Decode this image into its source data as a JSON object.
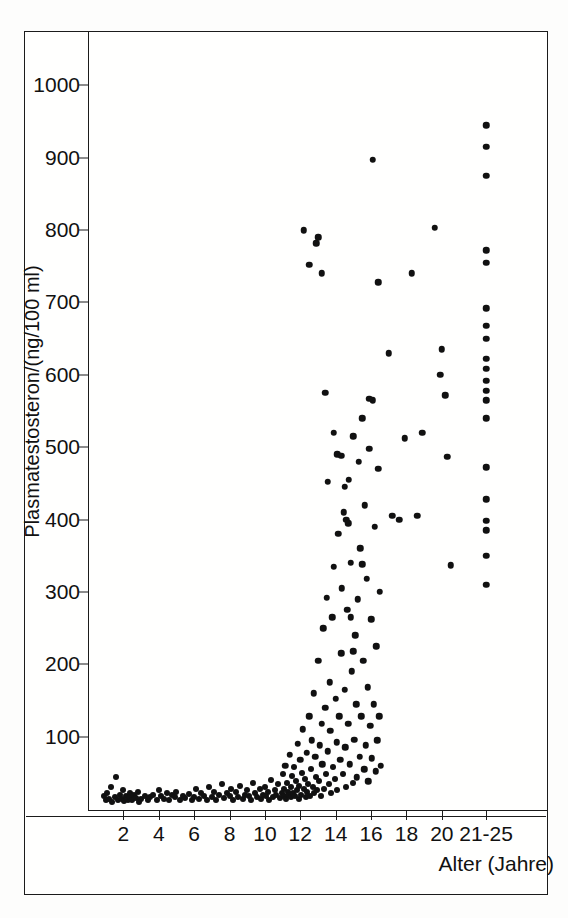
{
  "figure": {
    "kind": "scientific-scatter-figure",
    "background_color": "#fdfdfc",
    "ink_color": "#111111"
  },
  "axes": {
    "y_label": "Plasmatestosteron/(ng/100 ml)",
    "x_label": "Alter (Jahre)",
    "y_ticks": [
      "100",
      "200",
      "300",
      "400",
      "500",
      "600",
      "700",
      "800",
      "900",
      "1000"
    ],
    "x_ticks": [
      "2",
      "4",
      "6",
      "8",
      "10",
      "12",
      "14",
      "16",
      "18",
      "20",
      "21-25"
    ]
  },
  "chart_data": {
    "type": "scatter",
    "title": "",
    "xlabel": "Alter (Jahre)",
    "ylabel": "Plasmatestosteron/(ng/100 ml)",
    "xlim": [
      0,
      26
    ],
    "ylim": [
      0,
      1075
    ],
    "grid": false,
    "legend": null,
    "x_tick_values": [
      2,
      4,
      6,
      8,
      10,
      12,
      14,
      16,
      18,
      20,
      22.5
    ],
    "x_tick_labels": [
      "2",
      "4",
      "6",
      "8",
      "10",
      "12",
      "14",
      "16",
      "18",
      "20",
      "21-25"
    ],
    "y_tick_values": [
      100,
      200,
      300,
      400,
      500,
      600,
      700,
      800,
      900,
      1000
    ],
    "y_tick_labels": [
      "100",
      "200",
      "300",
      "400",
      "500",
      "600",
      "700",
      "800",
      "900",
      "1000"
    ],
    "marker": "filled-circle",
    "marker_color": "#111111",
    "note": "Serum testosterone versus age in boys/men; values rise sharply after age ~11.",
    "points": [
      [
        0.9,
        18
      ],
      [
        1.0,
        12
      ],
      [
        1.1,
        22
      ],
      [
        1.2,
        14
      ],
      [
        1.3,
        30
      ],
      [
        1.35,
        10
      ],
      [
        1.5,
        16
      ],
      [
        1.6,
        44
      ],
      [
        1.7,
        12
      ],
      [
        1.8,
        20
      ],
      [
        1.9,
        14
      ],
      [
        2.0,
        26
      ],
      [
        2.05,
        11
      ],
      [
        2.15,
        18
      ],
      [
        2.25,
        13
      ],
      [
        2.35,
        22
      ],
      [
        2.4,
        16
      ],
      [
        2.5,
        12
      ],
      [
        2.6,
        20
      ],
      [
        2.7,
        15
      ],
      [
        2.8,
        24
      ],
      [
        2.9,
        10
      ],
      [
        3.0,
        14
      ],
      [
        3.2,
        18
      ],
      [
        3.4,
        12
      ],
      [
        3.5,
        16
      ],
      [
        3.7,
        20
      ],
      [
        3.9,
        13
      ],
      [
        4.0,
        26
      ],
      [
        4.15,
        18
      ],
      [
        4.3,
        14
      ],
      [
        4.45,
        22
      ],
      [
        4.6,
        12
      ],
      [
        4.75,
        20
      ],
      [
        4.9,
        16
      ],
      [
        5.0,
        24
      ],
      [
        5.2,
        13
      ],
      [
        5.35,
        18
      ],
      [
        5.5,
        15
      ],
      [
        5.7,
        21
      ],
      [
        5.85,
        12
      ],
      [
        6.0,
        17
      ],
      [
        6.1,
        28
      ],
      [
        6.25,
        14
      ],
      [
        6.4,
        22
      ],
      [
        6.55,
        18
      ],
      [
        6.7,
        12
      ],
      [
        6.85,
        30
      ],
      [
        7.0,
        16
      ],
      [
        7.1,
        24
      ],
      [
        7.25,
        13
      ],
      [
        7.4,
        20
      ],
      [
        7.55,
        34
      ],
      [
        7.7,
        15
      ],
      [
        7.85,
        22
      ],
      [
        8.0,
        18
      ],
      [
        8.1,
        28
      ],
      [
        8.2,
        12
      ],
      [
        8.35,
        24
      ],
      [
        8.5,
        16
      ],
      [
        8.6,
        32
      ],
      [
        8.75,
        14
      ],
      [
        8.9,
        20
      ],
      [
        9.0,
        26
      ],
      [
        9.1,
        18
      ],
      [
        9.2,
        12
      ],
      [
        9.3,
        36
      ],
      [
        9.45,
        22
      ],
      [
        9.55,
        16
      ],
      [
        9.7,
        28
      ],
      [
        9.8,
        14
      ],
      [
        9.9,
        20
      ],
      [
        10.0,
        30
      ],
      [
        10.05,
        18
      ],
      [
        10.15,
        24
      ],
      [
        10.25,
        13
      ],
      [
        10.35,
        40
      ],
      [
        10.45,
        16
      ],
      [
        10.55,
        26
      ],
      [
        10.65,
        20
      ],
      [
        10.75,
        34
      ],
      [
        10.85,
        15
      ],
      [
        10.95,
        22
      ],
      [
        11.0,
        48
      ],
      [
        11.05,
        18
      ],
      [
        11.1,
        28
      ],
      [
        11.15,
        60
      ],
      [
        11.2,
        14
      ],
      [
        11.25,
        36
      ],
      [
        11.3,
        24
      ],
      [
        11.35,
        20
      ],
      [
        11.4,
        75
      ],
      [
        11.45,
        16
      ],
      [
        11.5,
        30
      ],
      [
        11.55,
        45
      ],
      [
        11.6,
        22
      ],
      [
        11.65,
        58
      ],
      [
        11.7,
        18
      ],
      [
        11.75,
        38
      ],
      [
        11.8,
        26
      ],
      [
        11.85,
        90
      ],
      [
        11.9,
        14
      ],
      [
        11.95,
        32
      ],
      [
        12.0,
        68
      ],
      [
        12.05,
        20
      ],
      [
        12.1,
        50
      ],
      [
        12.15,
        110
      ],
      [
        12.2,
        28
      ],
      [
        12.25,
        42
      ],
      [
        12.3,
        16
      ],
      [
        12.35,
        78
      ],
      [
        12.4,
        24
      ],
      [
        12.45,
        35
      ],
      [
        12.5,
        128
      ],
      [
        12.55,
        18
      ],
      [
        12.6,
        55
      ],
      [
        12.65,
        95
      ],
      [
        12.7,
        30
      ],
      [
        12.75,
        160
      ],
      [
        12.8,
        22
      ],
      [
        12.85,
        72
      ],
      [
        12.9,
        44
      ],
      [
        12.95,
        26
      ],
      [
        13.0,
        205
      ],
      [
        13.05,
        38
      ],
      [
        13.1,
        88
      ],
      [
        13.15,
        18
      ],
      [
        13.2,
        118
      ],
      [
        13.25,
        62
      ],
      [
        13.3,
        250
      ],
      [
        13.35,
        28
      ],
      [
        13.4,
        140
      ],
      [
        13.45,
        48
      ],
      [
        13.5,
        292
      ],
      [
        13.55,
        80
      ],
      [
        13.6,
        34
      ],
      [
        13.65,
        175
      ],
      [
        13.7,
        108
      ],
      [
        13.75,
        22
      ],
      [
        13.8,
        265
      ],
      [
        13.85,
        58
      ],
      [
        13.9,
        335
      ],
      [
        13.95,
        42
      ],
      [
        14.0,
        152
      ],
      [
        14.05,
        92
      ],
      [
        14.1,
        26
      ],
      [
        14.15,
        380
      ],
      [
        14.2,
        128
      ],
      [
        14.25,
        68
      ],
      [
        14.3,
        215
      ],
      [
        14.35,
        305
      ],
      [
        14.4,
        48
      ],
      [
        14.45,
        410
      ],
      [
        14.5,
        165
      ],
      [
        14.55,
        85
      ],
      [
        14.6,
        30
      ],
      [
        14.65,
        275
      ],
      [
        14.7,
        118
      ],
      [
        14.75,
        455
      ],
      [
        14.8,
        62
      ],
      [
        14.85,
        340
      ],
      [
        14.9,
        190
      ],
      [
        14.95,
        36
      ],
      [
        15.0,
        515
      ],
      [
        15.05,
        96
      ],
      [
        15.1,
        240
      ],
      [
        15.15,
        145
      ],
      [
        15.2,
        44
      ],
      [
        15.25,
        290
      ],
      [
        15.3,
        480
      ],
      [
        15.35,
        72
      ],
      [
        15.4,
        360
      ],
      [
        15.45,
        128
      ],
      [
        15.5,
        540
      ],
      [
        15.55,
        205
      ],
      [
        15.6,
        55
      ],
      [
        15.65,
        420
      ],
      [
        15.7,
        88
      ],
      [
        15.75,
        318
      ],
      [
        15.8,
        168
      ],
      [
        15.85,
        38
      ],
      [
        15.9,
        498
      ],
      [
        15.95,
        115
      ],
      [
        16.0,
        262
      ],
      [
        16.05,
        70
      ],
      [
        16.1,
        565
      ],
      [
        16.15,
        145
      ],
      [
        16.2,
        390
      ],
      [
        16.25,
        52
      ],
      [
        16.3,
        225
      ],
      [
        16.35,
        95
      ],
      [
        16.4,
        470
      ],
      [
        16.45,
        128
      ],
      [
        16.5,
        300
      ],
      [
        16.55,
        60
      ],
      [
        12.2,
        800
      ],
      [
        12.5,
        752
      ],
      [
        12.9,
        782
      ],
      [
        13.0,
        790
      ],
      [
        13.2,
        740
      ],
      [
        13.4,
        575
      ],
      [
        13.55,
        452
      ],
      [
        13.9,
        520
      ],
      [
        14.1,
        490
      ],
      [
        14.3,
        488
      ],
      [
        14.5,
        445
      ],
      [
        14.6,
        400
      ],
      [
        14.7,
        395
      ],
      [
        14.85,
        265
      ],
      [
        15.0,
        218
      ],
      [
        15.5,
        338
      ],
      [
        15.9,
        567
      ],
      [
        16.1,
        897
      ],
      [
        16.4,
        728
      ],
      [
        17.0,
        630
      ],
      [
        17.2,
        405
      ],
      [
        17.6,
        400
      ],
      [
        17.9,
        512
      ],
      [
        18.3,
        740
      ],
      [
        18.6,
        405
      ],
      [
        18.9,
        520
      ],
      [
        19.6,
        803
      ],
      [
        19.9,
        600
      ],
      [
        20.0,
        635
      ],
      [
        20.2,
        572
      ],
      [
        20.3,
        487
      ],
      [
        20.5,
        337
      ],
      [
        22.5,
        945
      ],
      [
        22.5,
        915
      ],
      [
        22.5,
        875
      ],
      [
        22.5,
        772
      ],
      [
        22.5,
        755
      ],
      [
        22.5,
        692
      ],
      [
        22.5,
        668
      ],
      [
        22.5,
        650
      ],
      [
        22.5,
        622
      ],
      [
        22.5,
        608
      ],
      [
        22.5,
        592
      ],
      [
        22.5,
        578
      ],
      [
        22.5,
        565
      ],
      [
        22.5,
        540
      ],
      [
        22.5,
        472
      ],
      [
        22.5,
        428
      ],
      [
        22.5,
        398
      ],
      [
        22.5,
        385
      ],
      [
        22.5,
        350
      ],
      [
        22.5,
        310
      ]
    ]
  }
}
